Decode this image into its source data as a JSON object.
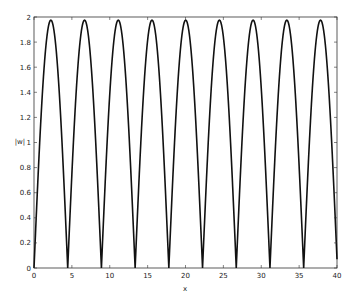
{
  "chart_data": {
    "type": "line",
    "title": "",
    "xlabel": "x",
    "ylabel": "|w|",
    "xlim": [
      0,
      40
    ],
    "ylim": [
      0,
      2
    ],
    "xticks": [
      0,
      5,
      10,
      15,
      20,
      25,
      30,
      35,
      40
    ],
    "yticks": [
      0,
      0.2,
      0.4,
      0.6,
      0.8,
      1,
      1.2,
      1.4,
      1.6,
      1.8,
      2
    ],
    "ytick_labels": [
      "0",
      "0.2",
      "0.4",
      "0.6",
      "0.8",
      "1",
      "1.2",
      "1.4",
      "1.6",
      "1.8",
      "2"
    ],
    "grid": false,
    "series": [
      {
        "name": "|w|",
        "function": "1.975*|sin(pi*x/4.45)|",
        "period": 4.45,
        "peak": 1.975,
        "zeros_x": [
          0,
          4.45,
          8.9,
          13.35,
          17.8,
          22.25,
          26.7,
          31.15,
          35.6,
          40.05
        ],
        "peaks_x": [
          2.22,
          6.67,
          11.12,
          15.57,
          20.02,
          24.47,
          28.92,
          33.37,
          37.82
        ]
      }
    ]
  }
}
